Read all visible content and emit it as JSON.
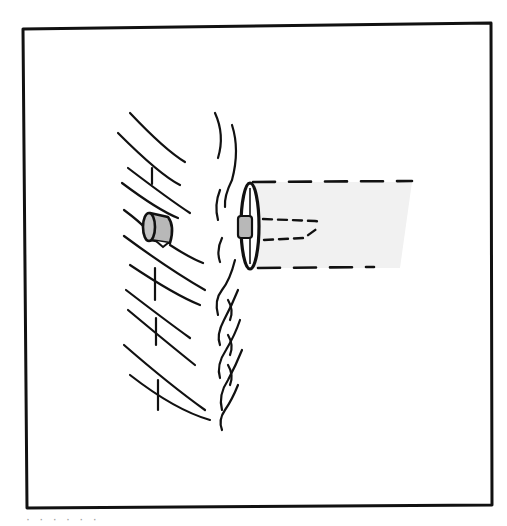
{
  "figure": {
    "frame": {
      "x": 22,
      "y": 26,
      "width": 470,
      "height": 480,
      "stroke": "#111111"
    },
    "colors": {
      "line": "#111111",
      "bolt_fill": "#b8b8b8",
      "projection_shade": "#f1f1f1",
      "background": "#ffffff"
    },
    "caption_fragment": "· · · ·   ·        ·"
  }
}
